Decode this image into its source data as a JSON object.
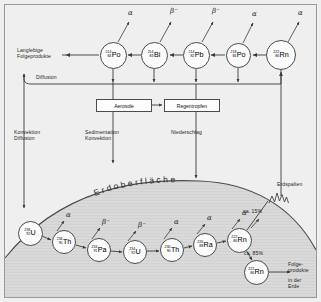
{
  "diagram": {
    "surface_label": "Erdoberfläche",
    "colors": {
      "background": "#efefef",
      "ground": "#d8d8d8",
      "node_fill": "#fbfbfb",
      "stroke": "#4a4a4a",
      "text": "#1d1d1d"
    },
    "atmosphere_chain": [
      {
        "id": "po214",
        "mass": "214",
        "atomic": "84",
        "symbol": "Po",
        "emission": "α",
        "x": 113,
        "y": 55,
        "r": 13.5
      },
      {
        "id": "bi214",
        "mass": "214",
        "atomic": "83",
        "symbol": "Bi",
        "emission": "β⁻",
        "x": 154,
        "y": 55,
        "r": 13.5
      },
      {
        "id": "pb214",
        "mass": "214",
        "atomic": "82",
        "symbol": "Pb",
        "emission": "β⁻",
        "x": 196,
        "y": 55,
        "r": 13.5
      },
      {
        "id": "po218",
        "mass": "218",
        "atomic": "84",
        "symbol": "Po",
        "emission": "α",
        "x": 238,
        "y": 55,
        "r": 12.5
      },
      {
        "id": "rn222",
        "mass": "222",
        "atomic": "86",
        "symbol": "Rn",
        "emission": "α",
        "x": 281,
        "y": 55,
        "r": 15.0
      }
    ],
    "ground_chain": [
      {
        "id": "u238",
        "mass": "238",
        "atomic": "92",
        "symbol": "U",
        "emission": "",
        "x": 30,
        "y": 233,
        "r": 12.5
      },
      {
        "id": "th234",
        "mass": "234",
        "atomic": "90",
        "symbol": "Th",
        "emission": "α",
        "x": 64,
        "y": 242,
        "r": 12.0
      },
      {
        "id": "pa234",
        "mass": "234",
        "atomic": "91",
        "symbol": "Pa",
        "emission": "β⁻",
        "x": 99,
        "y": 250,
        "r": 12.0
      },
      {
        "id": "u234",
        "mass": "234",
        "atomic": "92",
        "symbol": "U",
        "emission": "β⁻",
        "x": 135,
        "y": 252,
        "r": 12.0
      },
      {
        "id": "th230",
        "mass": "230",
        "atomic": "90",
        "symbol": "Th",
        "emission": "α",
        "x": 172,
        "y": 250,
        "r": 12.0
      },
      {
        "id": "ra226",
        "mass": "226",
        "atomic": "88",
        "symbol": "Ra",
        "emission": "α",
        "x": 205,
        "y": 245,
        "r": 12.0
      },
      {
        "id": "rn222g",
        "mass": "222",
        "atomic": "86",
        "symbol": "Rn",
        "emission": "α",
        "x": 239,
        "y": 240,
        "r": 12.5
      },
      {
        "id": "rn222e",
        "mass": "222",
        "atomic": "86",
        "symbol": "Rn",
        "emission": "",
        "x": 256,
        "y": 272,
        "r": 12.5
      }
    ],
    "boxes": [
      {
        "id": "aerosole",
        "label": "Aerosole",
        "x": 96,
        "y": 99,
        "w": 56,
        "h": 13
      },
      {
        "id": "regentropfen",
        "label": "Regentropfen",
        "x": 164,
        "y": 99,
        "w": 56,
        "h": 13
      }
    ],
    "labels": {
      "langlebige": "Langlebige\nFolgeprodukte",
      "diffusion": "Diffusion",
      "konvektion_diff": "Konvektion\nDiffusion",
      "sediment_konv": "Sedimentation\nKonvektion",
      "niederschlag": "Niederschlag",
      "erdspalten": "Erdspalten",
      "pct_15": "ca. 15%",
      "pct_85": "ca. 85%",
      "folgeprodukte": "Folge-\nprodukte",
      "in_der_erde": "in der\nErde"
    },
    "emissions": {
      "alpha": "α",
      "beta_minus": "β⁻"
    }
  }
}
